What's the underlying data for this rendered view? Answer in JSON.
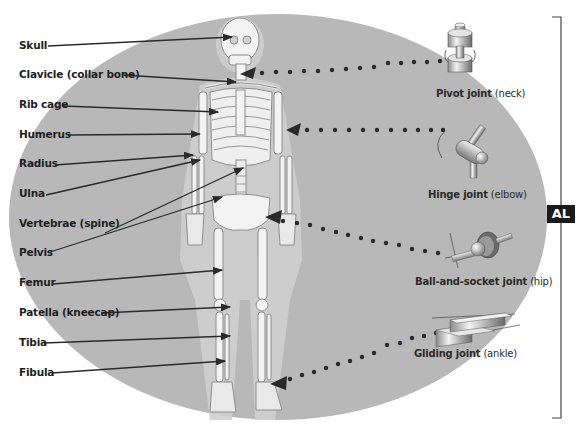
{
  "diagram": {
    "background_color": "#b8b8b8",
    "badge": {
      "text": "AL"
    },
    "bone_labels": [
      {
        "label": "Skull",
        "x": 19,
        "y": 46
      },
      {
        "label": "Clavicle (collar bone)",
        "x": 19,
        "y": 75
      },
      {
        "label": "Rib cage",
        "x": 19,
        "y": 105
      },
      {
        "label": "Humerus",
        "x": 19,
        "y": 134
      },
      {
        "label": "Radius",
        "x": 19,
        "y": 164
      },
      {
        "label": "Ulna",
        "x": 19,
        "y": 194
      },
      {
        "label": "Vertebrae (spine)",
        "x": 19,
        "y": 224
      },
      {
        "label": "Pelvis",
        "x": 19,
        "y": 253
      },
      {
        "label": "Femur",
        "x": 19,
        "y": 283
      },
      {
        "label": "Patella (kneecap)",
        "x": 19,
        "y": 313
      },
      {
        "label": "Tibia",
        "x": 19,
        "y": 343
      },
      {
        "label": "Fibula",
        "x": 19,
        "y": 373
      }
    ],
    "joints": [
      {
        "name": "Pivot joint",
        "location": "(neck)",
        "icon": "pivot-joint-icon"
      },
      {
        "name": "Hinge joint",
        "location": "(elbow)",
        "icon": "hinge-joint-icon"
      },
      {
        "name": "Ball-and-socket joint",
        "location": "(hip)",
        "icon": "ball-socket-joint-icon"
      },
      {
        "name": "Gliding joint",
        "location": "(ankle)",
        "icon": "gliding-joint-icon"
      }
    ]
  }
}
